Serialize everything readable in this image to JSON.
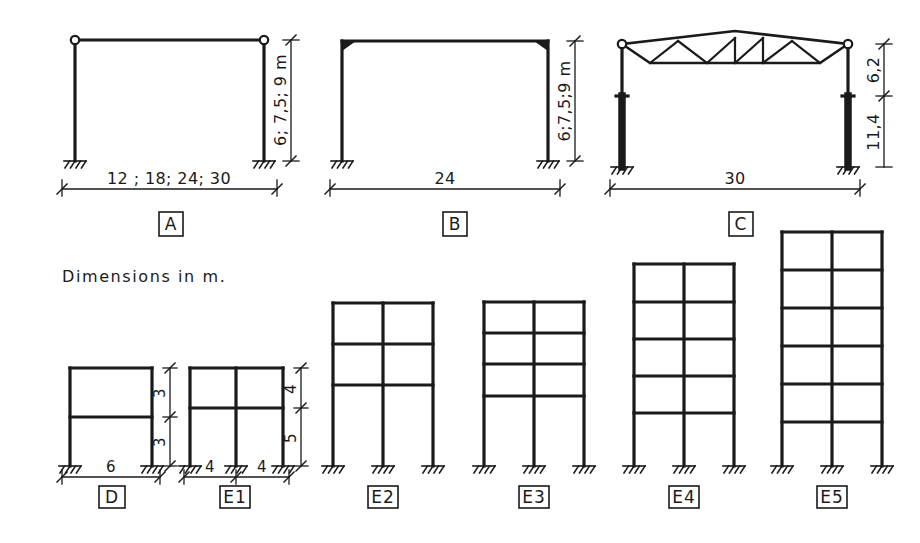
{
  "figure": {
    "caption": "Dimensions in m.",
    "unit": "m"
  },
  "portal_frames": [
    {
      "id": "A",
      "label": "A",
      "span_text": "12 ; 18; 24; 30",
      "height_text": "6; 7,5; 9 m",
      "joint_type": "pinned-corner",
      "support": "fixed"
    },
    {
      "id": "B",
      "label": "B",
      "span_text": "24",
      "height_text": "6;7,5;9 m",
      "joint_type": "rigid-haunch-corner",
      "support": "fixed"
    },
    {
      "id": "C",
      "label": "C",
      "span_text": "30",
      "truss_height_text": "6,2",
      "column_height_text": "11,4",
      "joint_type": "pinned-truss",
      "support": "fixed"
    }
  ],
  "building_frames": [
    {
      "id": "D",
      "label": "D",
      "bays": 1,
      "storeys": 2,
      "bay_widths_text": [
        "6"
      ],
      "storey_heights_text": [
        "3",
        "3"
      ]
    },
    {
      "id": "E1",
      "label": "E1",
      "bays": 2,
      "storeys": 2,
      "bay_widths_text": [
        "4",
        "4"
      ],
      "storey_heights_text": [
        "5",
        "4"
      ]
    },
    {
      "id": "E2",
      "label": "E2",
      "bays": 2,
      "storeys": 3,
      "bay_widths_text": [],
      "storey_heights_text": []
    },
    {
      "id": "E3",
      "label": "E3",
      "bays": 2,
      "storeys": 4,
      "bay_widths_text": [],
      "storey_heights_text": []
    },
    {
      "id": "E4",
      "label": "E4",
      "bays": 2,
      "storeys": 5,
      "bay_widths_text": [],
      "storey_heights_text": []
    },
    {
      "id": "E5",
      "label": "E5",
      "bays": 2,
      "storeys": 6,
      "bay_widths_text": [],
      "storey_heights_text": []
    }
  ],
  "colors": {
    "ink": "#1a1a1a",
    "paper": "#ffffff"
  }
}
